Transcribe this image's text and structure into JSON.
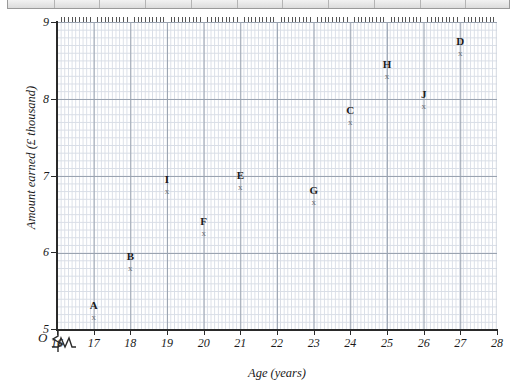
{
  "toolbar": {
    "name": "partial-toolbar-strip",
    "segments": 11
  },
  "chart_data": {
    "type": "scatter",
    "title": "",
    "xlabel": "Age (years)",
    "ylabel": "Amount earned (£ thousand)",
    "xlim": [
      16,
      28
    ],
    "ylim": [
      5,
      9
    ],
    "xticks": [
      16,
      17,
      18,
      19,
      20,
      21,
      22,
      23,
      24,
      25,
      26,
      27,
      28
    ],
    "yticks": [
      5,
      6,
      7,
      8,
      9
    ],
    "x_minor_step": 0.1,
    "y_minor_step": 0.1,
    "grid": true,
    "legend": "none",
    "axis_break_x": true,
    "axis_break_y": true,
    "origin_label": "O",
    "marker": "x",
    "marker_color": "#6b6f76",
    "grid_major_color": "#9aa3b0",
    "grid_minor_color": "#d8dde6",
    "axis_color": "#2a2a2a",
    "points": [
      {
        "label": "A",
        "x": 17,
        "y": 5.15
      },
      {
        "label": "B",
        "x": 18,
        "y": 5.8
      },
      {
        "label": "I",
        "x": 19,
        "y": 6.8
      },
      {
        "label": "F",
        "x": 20,
        "y": 6.25
      },
      {
        "label": "E",
        "x": 21,
        "y": 6.85
      },
      {
        "label": "G",
        "x": 23,
        "y": 6.65
      },
      {
        "label": "C",
        "x": 24,
        "y": 7.7
      },
      {
        "label": "H",
        "x": 25,
        "y": 8.3
      },
      {
        "label": "J",
        "x": 26,
        "y": 7.9
      },
      {
        "label": "D",
        "x": 27,
        "y": 8.6
      }
    ]
  }
}
